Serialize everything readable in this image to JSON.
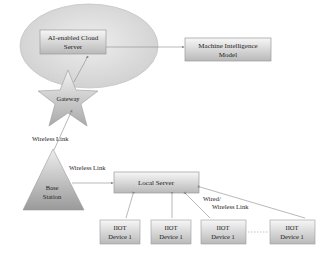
{
  "diagram": {
    "nodes": {
      "cloud_server": {
        "line1": "AI-enabled Cloud",
        "line2": "Server"
      },
      "machine_intelligence": {
        "line1": "Machine Intelligence",
        "line2": "Model"
      },
      "gateway": {
        "label": "Gateway"
      },
      "base_station": {
        "line1": "Base",
        "line2": "Station"
      },
      "local_server": {
        "label": "Local Server"
      },
      "iiot_devices": [
        {
          "line1": "IIOT",
          "line2": "Device 1"
        },
        {
          "line1": "IIOT",
          "line2": "Device 1"
        },
        {
          "line1": "IIOT",
          "line2": "Device 1"
        },
        {
          "line1": "IIOT",
          "line2": "Device 1"
        }
      ]
    },
    "edges": {
      "gateway_base_label": "Wireless  Link",
      "base_local_label": "Wireless  Link",
      "local_device_label_1": "Wired/",
      "local_device_label_2": "Wireless  Link"
    },
    "colors": {
      "ellipse_fill": "#d9d9d9",
      "box_top": "#f4f4f4",
      "box_bottom": "#bdbdbd",
      "line": "#8a8a8a",
      "text": "#222222"
    }
  }
}
